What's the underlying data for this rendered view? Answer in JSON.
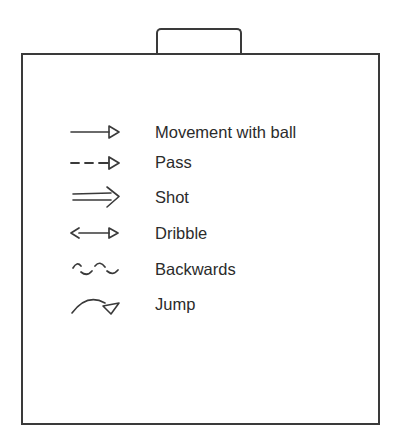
{
  "legend": {
    "items": [
      {
        "label": "Movement with ball",
        "icon": "solid-arrow-icon"
      },
      {
        "label": "Pass",
        "icon": "dashed-arrow-icon"
      },
      {
        "label": "Shot",
        "icon": "double-line-arrow-icon"
      },
      {
        "label": "Dribble",
        "icon": "double-headed-arrow-icon"
      },
      {
        "label": "Backwards",
        "icon": "wavy-line-icon"
      },
      {
        "label": "Jump",
        "icon": "curved-arrow-icon"
      }
    ]
  },
  "colors": {
    "stroke": "#3a3a3a",
    "text": "#2b2b2b",
    "background": "#ffffff"
  }
}
